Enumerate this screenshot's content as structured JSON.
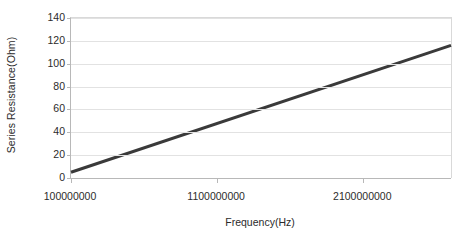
{
  "chart_data": {
    "type": "line",
    "title": "",
    "xlabel": "Frequency(Hz)",
    "ylabel": "Series Resistance(Ohm)",
    "xlim": [
      100000000,
      2700000000
    ],
    "ylim": [
      0,
      140
    ],
    "grid": true,
    "legend": false,
    "xticks": [
      100000000,
      1100000000,
      2100000000
    ],
    "xtick_labels": [
      "100000000",
      "1100000000",
      "2100000000"
    ],
    "yticks": [
      0,
      20,
      40,
      60,
      80,
      100,
      120,
      140
    ],
    "ytick_labels": [
      "0",
      "20",
      "40",
      "60",
      "80",
      "100",
      "120",
      "140"
    ],
    "series": [
      {
        "name": "Series Resistance",
        "color": "#3a3a3a",
        "line_width": 3,
        "x": [
          100000000,
          2700000000
        ],
        "values": [
          5,
          116
        ]
      }
    ]
  }
}
